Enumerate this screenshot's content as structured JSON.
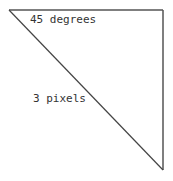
{
  "diagram": {
    "shape": "right-triangle",
    "labels": {
      "angle": "45 degrees",
      "stroke": "3 pixels"
    },
    "vertices": [
      [
        9,
        10
      ],
      [
        163,
        10
      ],
      [
        163,
        170
      ]
    ],
    "colors": {
      "stroke": "#555555",
      "text": "#333333",
      "background": "#ffffff"
    }
  }
}
